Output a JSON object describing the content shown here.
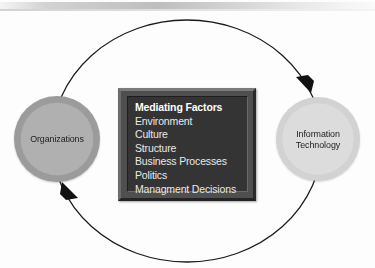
{
  "diagram": {
    "background_color": "#fdfdfd",
    "nodes": [
      {
        "id": "organizations",
        "label": "Organizations",
        "shape": "circle",
        "ring_color": "#9b9b9b",
        "fill_color": "#b0b0b0",
        "text_color": "#1d1d1d"
      },
      {
        "id": "information-technology",
        "label": "Information\nTechnology",
        "shape": "circle",
        "ring_color": "#d2d2d2",
        "fill_color": "#dcdcdc",
        "text_color": "#1d1d1d"
      }
    ],
    "mediating_box": {
      "heading": "Mediating Factors",
      "factors": [
        "Environment",
        "Culture",
        "Structure",
        "Business Processes",
        "Politics",
        "Managment Decisions"
      ],
      "frame_color": "#4f4f4f",
      "panel_color": "#343434",
      "text_color": "#e9e9e9"
    },
    "connector": {
      "shape": "ellipse",
      "style": "bidirectional feedback loop",
      "stroke_color": "#1a1a1a",
      "stroke_width": 1.3,
      "arrowheads": [
        {
          "id": "arrow-to-information-technology",
          "direction": "clockwise along top arc, pointing down-right into Information Technology"
        },
        {
          "id": "arrow-to-organizations",
          "direction": "counter-clockwise along bottom arc, pointing up-left into Organizations"
        }
      ]
    }
  }
}
